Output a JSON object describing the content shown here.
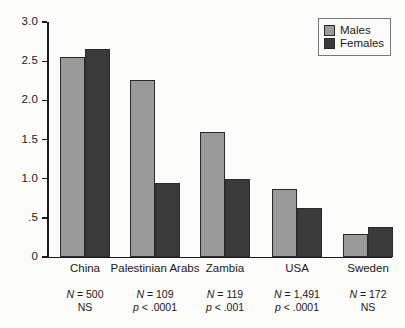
{
  "chart_data": {
    "type": "bar",
    "title": "",
    "xlabel": "",
    "ylabel": "",
    "ylim": [
      0,
      3.0
    ],
    "ytick_labels": [
      "3.0",
      "2.5",
      "2.0",
      "1.5",
      "1.0",
      ".5",
      "0"
    ],
    "ytick_values": [
      3.0,
      2.5,
      2.0,
      1.5,
      1.0,
      0.5,
      0
    ],
    "grid": false,
    "legend_position": "top-right",
    "categories": [
      "China",
      "Palestinian Arabs",
      "Zambia",
      "USA",
      "Sweden"
    ],
    "series": [
      {
        "name": "Males",
        "color": "#9a9a9a",
        "values": [
          2.55,
          2.26,
          1.6,
          0.87,
          0.29
        ]
      },
      {
        "name": "Females",
        "color": "#3a3a3a",
        "values": [
          2.65,
          0.95,
          1.0,
          0.62,
          0.38
        ]
      }
    ],
    "annotations": [
      {
        "n": "N = 500",
        "p": "NS"
      },
      {
        "n": "N = 109",
        "p": "p < .0001"
      },
      {
        "n": "N = 119",
        "p": "p < .001"
      },
      {
        "n": "N = 1,491",
        "p": "p < .0001"
      },
      {
        "n": "N = 172",
        "p": "NS"
      }
    ],
    "annotation_n_prefix": "N",
    "annotation_n_values": [
      "= 500",
      "= 109",
      "= 119",
      "= 1,491",
      "= 172"
    ],
    "annotation_p_italic": [
      "",
      "p",
      "p",
      "p",
      ""
    ],
    "annotation_p_rest": [
      "NS",
      "< .0001",
      "< .001",
      "< .0001",
      "NS"
    ]
  },
  "legend": {
    "items": [
      {
        "label": "Males",
        "color": "#9a9a9a"
      },
      {
        "label": "Females",
        "color": "#3a3a3a"
      }
    ]
  },
  "colors": {
    "males": "#9a9a9a",
    "females": "#3a3a3a",
    "axis": "#1a1a1a",
    "background": "#fbfbf9"
  }
}
